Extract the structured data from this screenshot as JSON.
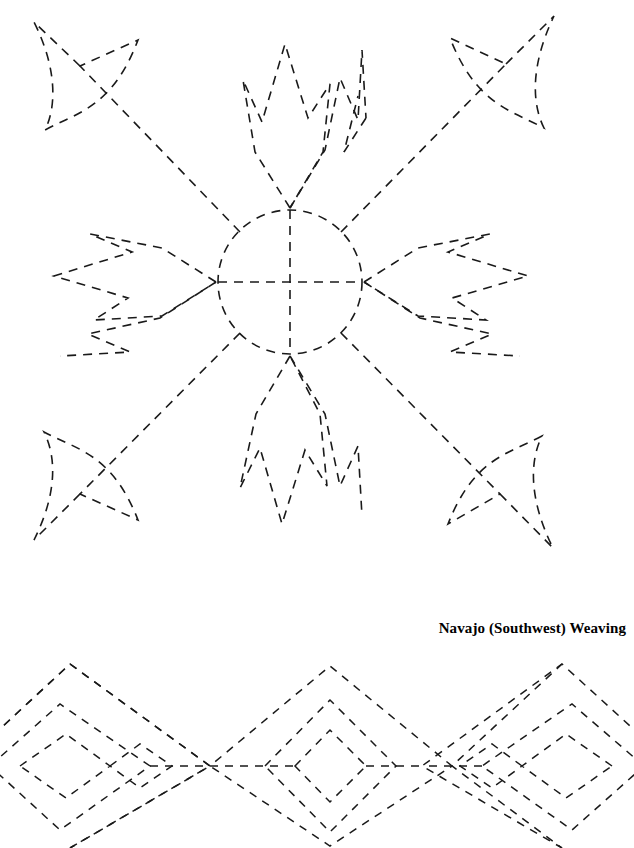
{
  "page": {
    "width": 634,
    "height": 848,
    "background": "#ffffff",
    "ink_color": "#1a1a1a"
  },
  "caption": {
    "text": "Navajo (Southwest) Weaving"
  },
  "figures": [
    {
      "name": "sun-face-motif",
      "description": "Dashed-outline Navajo sun/star motif: central circle with cross, four diagonal arrow rays to corner arrowheads, zigzag feather shapes top, bottom, left and right"
    },
    {
      "name": "diamond-band-motif",
      "description": "Dashed-outline Navajo weaving band: row of interlocking diamonds with stepped zigzag centers and a small diamond at the middle"
    }
  ]
}
